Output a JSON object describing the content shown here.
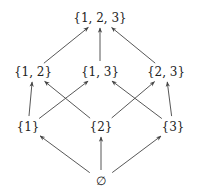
{
  "diagram": {
    "type": "hasse",
    "title": "",
    "nodes": [
      {
        "id": "s123",
        "label": "{1, 2, 3}",
        "x": 100,
        "y": 18
      },
      {
        "id": "s12",
        "label": "{1, 2}",
        "x": 33,
        "y": 72
      },
      {
        "id": "s13",
        "label": "{1, 3}",
        "x": 100,
        "y": 72
      },
      {
        "id": "s23",
        "label": "{2, 3}",
        "x": 166,
        "y": 72
      },
      {
        "id": "s1",
        "label": "{1}",
        "x": 28,
        "y": 127
      },
      {
        "id": "s2",
        "label": "{2}",
        "x": 101,
        "y": 127
      },
      {
        "id": "s3",
        "label": "{3}",
        "x": 173,
        "y": 127
      },
      {
        "id": "empty",
        "label": "∅",
        "x": 101,
        "y": 181
      }
    ],
    "edges": [
      {
        "from": "s12",
        "to": "s123"
      },
      {
        "from": "s13",
        "to": "s123"
      },
      {
        "from": "s23",
        "to": "s123"
      },
      {
        "from": "s1",
        "to": "s12"
      },
      {
        "from": "s1",
        "to": "s13"
      },
      {
        "from": "s2",
        "to": "s12"
      },
      {
        "from": "s2",
        "to": "s23"
      },
      {
        "from": "s3",
        "to": "s13"
      },
      {
        "from": "s3",
        "to": "s23"
      },
      {
        "from": "empty",
        "to": "s1"
      },
      {
        "from": "empty",
        "to": "s2"
      },
      {
        "from": "empty",
        "to": "s3"
      }
    ],
    "colors": {
      "edge": "#444444",
      "text": "#222222"
    }
  }
}
